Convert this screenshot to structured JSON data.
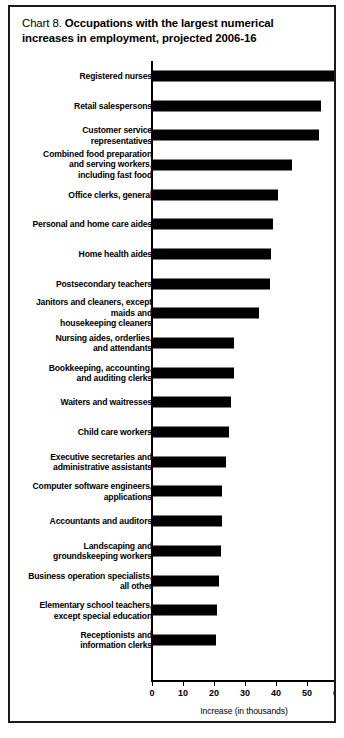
{
  "title": {
    "prefix": "Chart 8. ",
    "main": "Occupations with the largest numerical increases in employment, projected 2006-16"
  },
  "chart_data": {
    "type": "bar",
    "orientation": "horizontal",
    "title": "Chart 8. Occupations with the largest numerical increases in employment, projected 2006-16",
    "xlabel": "Increase (in thousands)",
    "ylabel": "",
    "xlim": [
      0,
      60
    ],
    "xticks": [
      0,
      10,
      20,
      30,
      40,
      50,
      60
    ],
    "xtick_labels": [
      "0",
      "10",
      "20",
      "30",
      "40",
      "50",
      "60"
    ],
    "grid": false,
    "legend": false,
    "bar_color": "#000000",
    "categories": [
      "Registered nurses",
      "Retail salespersons",
      "Customer service\nrepresentatives",
      "Combined food preparation\nand serving workers,\nincluding fast food",
      "Office clerks, general",
      "Personal and home care aides",
      "Home health aides",
      "Postsecondary teachers",
      "Janitors and cleaners, except\nmaids and\nhousekeeping cleaners",
      "Nursing aides, orderlies,\nand attendants",
      "Bookkeeping, accounting,\nand auditing clerks",
      "Waiters and waitresses",
      "Child care workers",
      "Executive secretaries and\nadministrative assistants",
      "Computer software engineers,\napplications",
      "Accountants and auditors",
      "Landscaping and\ngroundskeeping workers",
      "Business operation specialists,\nall other",
      "Elementary school teachers,\nexcept special education",
      "Receptionists and\ninformation clerks"
    ],
    "values": [
      58.7,
      54.5,
      54.0,
      45.2,
      40.5,
      38.9,
      38.4,
      38.0,
      34.5,
      26.5,
      26.4,
      25.5,
      24.7,
      24.0,
      22.6,
      22.6,
      22.2,
      21.6,
      21.0,
      20.5
    ]
  }
}
